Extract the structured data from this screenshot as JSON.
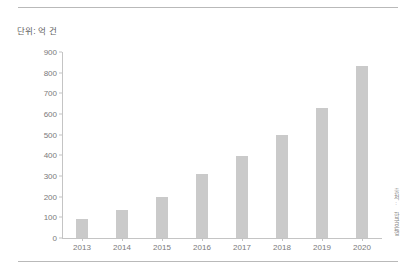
{
  "unit_label": "단위: 억 건",
  "side_caption": "출처: 한국은행",
  "colors": {
    "bar": "#cacaca",
    "axis": "#c4c4c4",
    "rule": "#b9b9b9",
    "tick_text": "#7a7a7a"
  },
  "chart_data": {
    "type": "bar",
    "title": "",
    "subtitle": "",
    "xlabel": "",
    "ylabel": "단위: 억 건",
    "categories": [
      "2013",
      "2014",
      "2015",
      "2016",
      "2017",
      "2018",
      "2019",
      "2020"
    ],
    "values": [
      90,
      135,
      200,
      310,
      395,
      500,
      630,
      830
    ],
    "ylim": [
      0,
      900
    ],
    "ytick_values": [
      0,
      100,
      200,
      300,
      400,
      500,
      600,
      700,
      800,
      900
    ],
    "ytick_labels": [
      "0",
      "100",
      "200",
      "300",
      "400",
      "500",
      "600",
      "700",
      "800",
      "900"
    ],
    "grid": false,
    "legend": null,
    "series": [
      {
        "name": "건수",
        "values": [
          90,
          135,
          200,
          310,
          395,
          500,
          630,
          830
        ]
      }
    ]
  }
}
